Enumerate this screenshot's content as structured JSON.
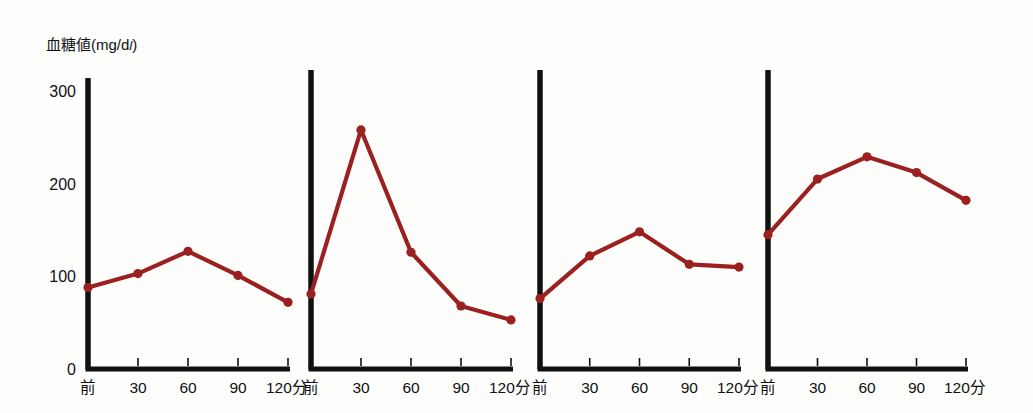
{
  "figure": {
    "title": "血糖値(mg/dl)",
    "title_main": "血糖値(mg/d",
    "title_unit_italic": "l",
    "title_tail": ")",
    "background_color": "#fdfdfc",
    "axis_color": "#111111",
    "line_color": "#9B2020",
    "marker_color": "#9B2020"
  },
  "chart_data": [
    {
      "type": "line",
      "title": "血糖値(mg/dl)",
      "panel_index": 1,
      "ylabel": "血糖値(mg/dl)",
      "xlabel": "",
      "categories": [
        "前",
        "30",
        "60",
        "90",
        "120分"
      ],
      "x_tick_labels": [
        "前",
        "30",
        "60",
        "90",
        "120分"
      ],
      "y_tick_labels": [
        "0",
        "100",
        "200",
        "300"
      ],
      "values": [
        88,
        103,
        127,
        101,
        72
      ],
      "ylim": [
        0,
        315
      ],
      "grid": false,
      "legend": "none",
      "y_axis_labeled": true,
      "line_color": "#9B2020"
    },
    {
      "type": "line",
      "title": "",
      "panel_index": 2,
      "ylabel": "",
      "xlabel": "",
      "categories": [
        "前",
        "30",
        "60",
        "90",
        "120分"
      ],
      "x_tick_labels": [
        "前",
        "30",
        "60",
        "90",
        "120分"
      ],
      "y_tick_labels": [],
      "values": [
        81,
        258,
        126,
        68,
        53
      ],
      "ylim": [
        0,
        315
      ],
      "grid": false,
      "legend": "none",
      "y_axis_labeled": false,
      "line_color": "#9B2020"
    },
    {
      "type": "line",
      "title": "",
      "panel_index": 3,
      "ylabel": "",
      "xlabel": "",
      "categories": [
        "前",
        "30",
        "60",
        "90",
        "120分"
      ],
      "x_tick_labels": [
        "前",
        "30",
        "60",
        "90",
        "120分"
      ],
      "y_tick_labels": [],
      "values": [
        76,
        122,
        148,
        113,
        110
      ],
      "ylim": [
        0,
        315
      ],
      "grid": false,
      "legend": "none",
      "y_axis_labeled": false,
      "line_color": "#9B2020"
    },
    {
      "type": "line",
      "title": "",
      "panel_index": 4,
      "ylabel": "",
      "xlabel": "",
      "categories": [
        "前",
        "30",
        "60",
        "90",
        "120分"
      ],
      "x_tick_labels": [
        "前",
        "30",
        "60",
        "90",
        "120分"
      ],
      "y_tick_labels": [],
      "values": [
        145,
        205,
        229,
        212,
        182
      ],
      "ylim": [
        0,
        315
      ],
      "grid": false,
      "legend": "none",
      "y_axis_labeled": false,
      "line_color": "#9B2020"
    }
  ],
  "axes": {
    "y_ticks": [
      "300",
      "200",
      "100",
      "0"
    ],
    "x_ticks": [
      "前",
      "30",
      "60",
      "90",
      "120分"
    ]
  },
  "geometry": {
    "panels": [
      {
        "x0": 88,
        "x1": 288,
        "y_top": 78,
        "y_base": 369
      },
      {
        "x0": 311,
        "x1": 511,
        "y_top": 70,
        "y_base": 369
      },
      {
        "x0": 540,
        "x1": 739,
        "y_top": 70,
        "y_base": 369
      },
      {
        "x0": 768,
        "x1": 966,
        "y_top": 70,
        "y_base": 369
      }
    ],
    "y_value_at_top_of_scale": 300,
    "y_pixel_at_300": 91,
    "y_pixel_at_0": 369,
    "title_pos": {
      "x": 46,
      "y": 50
    }
  }
}
